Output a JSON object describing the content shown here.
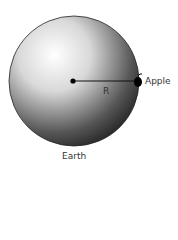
{
  "diagram": {
    "planet_label": "Earth",
    "object_label": "Apple",
    "radius_label": "R"
  }
}
